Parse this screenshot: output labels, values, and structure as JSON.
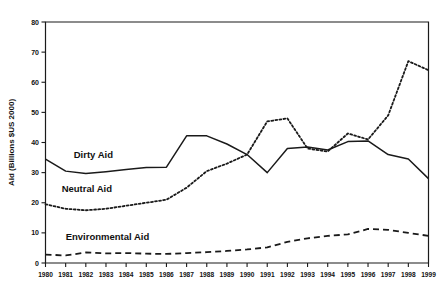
{
  "chart_data": {
    "type": "line",
    "title": "",
    "subtitle": "",
    "xlabel": "",
    "ylabel": "Aid (Billions $US 2000)",
    "xlim": [
      1980,
      1999
    ],
    "ylim": [
      0,
      80
    ],
    "yticks": [
      0,
      10,
      20,
      30,
      40,
      50,
      60,
      70,
      80
    ],
    "grid": false,
    "legend_position": "inline-labels",
    "x": [
      1980,
      1981,
      1982,
      1983,
      1984,
      1985,
      1986,
      1987,
      1988,
      1989,
      1990,
      1991,
      1992,
      1993,
      1994,
      1995,
      1996,
      1997,
      1998,
      1999
    ],
    "categories": [
      "1980",
      "1981",
      "1982",
      "1983",
      "1984",
      "1985",
      "1986",
      "1987",
      "1988",
      "1989",
      "1990",
      "1991",
      "1992",
      "1993",
      "1994",
      "1995",
      "1996",
      "1997",
      "1998",
      "1999"
    ],
    "series": [
      {
        "name": "Dirty Aid",
        "style": "solid",
        "color": "#1a1a1a",
        "values": [
          34.5,
          30.5,
          29.7,
          30.3,
          31.0,
          31.7,
          31.8,
          42.2,
          42.2,
          39.5,
          36.0,
          30.0,
          38.0,
          38.5,
          37.5,
          40.3,
          40.5,
          36.0,
          34.5,
          28.0
        ]
      },
      {
        "name": "Neutral Aid",
        "style": "dotted",
        "color": "#1a1a1a",
        "values": [
          19.5,
          18.0,
          17.5,
          18.0,
          19.0,
          20.0,
          21.0,
          25.0,
          30.5,
          33.0,
          36.0,
          47.0,
          48.0,
          38.0,
          37.0,
          43.0,
          41.0,
          49.0,
          67.0,
          64.0
        ]
      },
      {
        "name": "Environmental Aid",
        "style": "dashed",
        "color": "#1a1a1a",
        "values": [
          2.8,
          2.5,
          3.5,
          3.2,
          3.3,
          3.1,
          3.0,
          3.3,
          3.6,
          4.0,
          4.5,
          5.2,
          7.0,
          8.2,
          9.0,
          9.5,
          11.3,
          11.0,
          10.0,
          9.0
        ]
      }
    ],
    "annotations": [
      {
        "text": "Dirty Aid",
        "x": 1981.4,
        "y": 35.0
      },
      {
        "text": "Neutral Aid",
        "x": 1980.8,
        "y": 23.5
      },
      {
        "text": "Environmental Aid",
        "x": 1981.0,
        "y": 7.6
      }
    ]
  }
}
